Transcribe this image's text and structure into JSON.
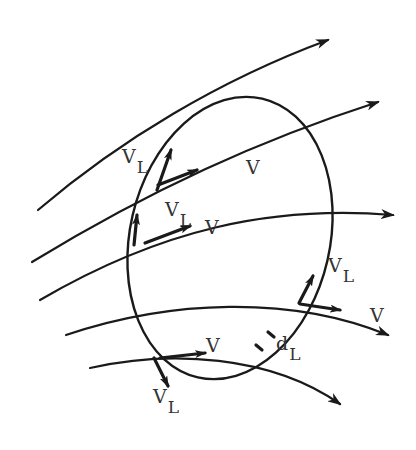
{
  "diagram": {
    "type": "streamlines-through-closed-loop",
    "colors": {
      "ink": "#1a1a1a",
      "text": "#333333",
      "background": "#ffffff"
    },
    "loop": {
      "name": "closed-curve-L",
      "cx": 230,
      "cy": 238,
      "rx": 100,
      "ry": 143,
      "rotate": 13
    },
    "streamlines": [
      {
        "id": 1,
        "path": "M38,210 C120,140 220,80 328,40",
        "arrow_at": [
          328,
          40
        ]
      },
      {
        "id": 2,
        "path": "M32,262 C150,190 260,140 378,102",
        "arrow_at": [
          378,
          102
        ]
      },
      {
        "id": 3,
        "path": "M40,300 C160,230 270,205 393,215",
        "arrow_at": [
          393,
          215
        ]
      },
      {
        "id": 4,
        "path": "M66,335 C170,300 290,295 388,335",
        "arrow_at": [
          388,
          335
        ]
      },
      {
        "id": 5,
        "path": "M90,368 C170,350 270,355 340,404",
        "arrow_at": [
          340,
          404
        ]
      }
    ],
    "labels": {
      "v_top": "V",
      "vl_top_main": "V",
      "vl_top_sub": "L",
      "v_mid": "V",
      "vl_mid_main": "V",
      "vl_mid_sub": "L",
      "vl_right_main": "V",
      "vl_right_sub": "L",
      "v_right": "V",
      "dl_main": "d",
      "dl_sub": "L",
      "v_bottom": "V",
      "vl_bottom_main": "V",
      "vl_bottom_sub": "L"
    }
  }
}
